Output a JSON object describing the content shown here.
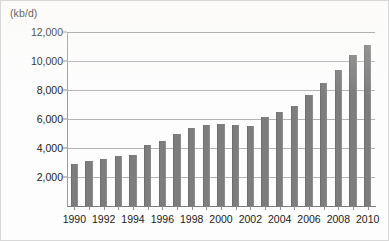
{
  "chart_data": {
    "type": "bar",
    "title": "",
    "subtitle": "",
    "xlabel": "",
    "ylabel": "(kb/d)",
    "ylim": [
      0,
      12000
    ],
    "ytick_labels": [
      "12,000",
      "10,000",
      "8,000",
      "6,000",
      "4,000",
      "2,000"
    ],
    "ytick_values": [
      12000,
      10000,
      8000,
      6000,
      4000,
      2000
    ],
    "grid": true,
    "legend": "none",
    "categories": [
      "1990",
      "1991",
      "1992",
      "1993",
      "1994",
      "1995",
      "1996",
      "1997",
      "1998",
      "1999",
      "2000",
      "2001",
      "2002",
      "2003",
      "2004",
      "2005",
      "2006",
      "2007",
      "2008",
      "2009",
      "2010"
    ],
    "xtick_labels": [
      "1990",
      "1992",
      "1994",
      "1996",
      "1998",
      "2000",
      "2002",
      "2004",
      "2006",
      "2008",
      "2010"
    ],
    "values": [
      2900,
      3100,
      3250,
      3450,
      3500,
      4200,
      4500,
      5000,
      5400,
      5600,
      5650,
      5600,
      5500,
      6150,
      6500,
      6900,
      7650,
      8450,
      9350,
      10400,
      11100
    ],
    "bar_color": "#7d7d7d",
    "gridline_color": "#9a9a9a",
    "background_color": "#fdfdfd",
    "text_color": "#1b1b1b"
  }
}
